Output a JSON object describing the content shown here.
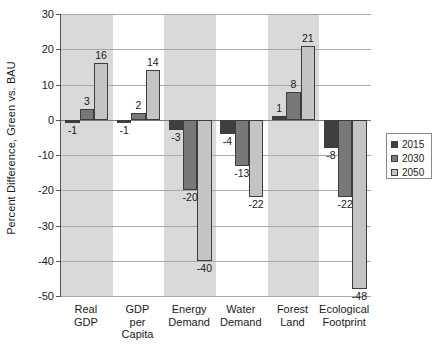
{
  "chart_data": {
    "type": "bar",
    "title": "",
    "xlabel": "",
    "ylabel": "Percent Difference, Green vs. BAU",
    "ylim": [
      -50,
      30
    ],
    "ytick_step": 10,
    "yticks": [
      "30",
      "20",
      "10",
      "0",
      "-10",
      "-20",
      "-30",
      "-40",
      "-50"
    ],
    "grid": true,
    "legend_position": "right",
    "categories": [
      "Real\nGDP",
      "GDP\nper\nCapita",
      "Energy\nDemand",
      "Water\nDemand",
      "Forest\nLand",
      "Ecological\nFootprint"
    ],
    "series": [
      {
        "name": "2015",
        "color": "#3f3f3f",
        "values": [
          -1,
          -1,
          -3,
          -4,
          1,
          -8
        ]
      },
      {
        "name": "2030",
        "color": "#787878",
        "values": [
          3,
          2,
          -20,
          -13,
          8,
          -22
        ]
      },
      {
        "name": "2050",
        "color": "#c4c4c4",
        "values": [
          16,
          14,
          -40,
          -22,
          21,
          -48
        ]
      }
    ],
    "value_labels": [
      [
        "-1",
        "-1",
        "-3",
        "-4",
        "1",
        "-8"
      ],
      [
        "3",
        "2",
        "-20",
        "-13",
        "8",
        "-22"
      ],
      [
        "16",
        "14",
        "-40",
        "-22",
        "21",
        "-48"
      ]
    ]
  },
  "legend": {
    "items": [
      {
        "label": "2015",
        "color": "#3f3f3f"
      },
      {
        "label": "2030",
        "color": "#787878"
      },
      {
        "label": "2050",
        "color": "#c4c4c4"
      }
    ]
  },
  "colors": {
    "band": "#d9d9d9",
    "gridline": "#a8a8a8",
    "axis": "#555555",
    "background": "#ffffff"
  }
}
